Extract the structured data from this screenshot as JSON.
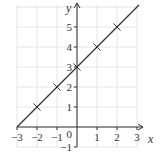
{
  "chart_data": {
    "type": "line",
    "title": "",
    "xlabel": "x",
    "ylabel": "y",
    "xlim": [
      -3,
      3
    ],
    "ylim": [
      -1,
      6
    ],
    "grid": true,
    "x_ticks": [
      -3,
      -2,
      -1,
      0,
      1,
      2,
      3
    ],
    "x_tick_labels": [
      "−3",
      "−2",
      "−1",
      "0",
      "1",
      "2",
      "3"
    ],
    "y_ticks": [
      -1,
      1,
      2,
      3,
      4,
      5
    ],
    "y_tick_labels": [
      "−1",
      "1",
      "2",
      "3",
      "4",
      "5"
    ],
    "origin_label": "0",
    "series": [
      {
        "name": "line",
        "equation": "y = x + 3",
        "x": [
          -3,
          3.1
        ],
        "y": [
          0,
          6.1
        ]
      },
      {
        "name": "points",
        "marker": "cross",
        "x": [
          -2,
          -1,
          0,
          1,
          2
        ],
        "y": [
          1,
          2,
          3,
          4,
          5
        ]
      }
    ],
    "colors": {
      "line": "#333333",
      "grid": "#e4e4e4",
      "axis": "#333333"
    }
  }
}
